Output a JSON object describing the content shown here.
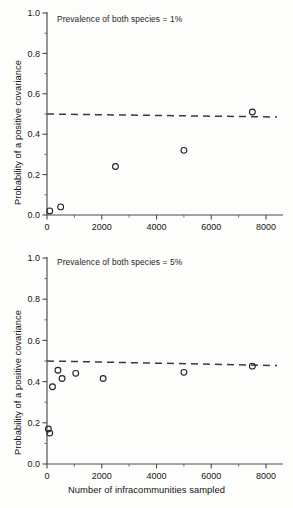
{
  "figure": {
    "xlabel": "Number of infracommunities sampled",
    "ylabel": "Probability of a positive covariance"
  },
  "chart_data": [
    {
      "type": "scatter",
      "title": "",
      "annotation": "Prevalence of both species = 1%",
      "xlabel": "",
      "ylabel": "Probability of a positive covariance",
      "xlim": [
        0,
        8400
      ],
      "ylim": [
        0,
        1.0
      ],
      "xticks": [
        0,
        2000,
        4000,
        6000,
        8000
      ],
      "xticklabels": [
        "0",
        "2000",
        "4000",
        "6000",
        "8000"
      ],
      "yticks": [
        0.0,
        0.2,
        0.4,
        0.6,
        0.8,
        1.0
      ],
      "yticklabels": [
        "0.0",
        "0.2",
        "0.4",
        "0.6",
        "0.8",
        "1.0"
      ],
      "grid": false,
      "legend": "none",
      "marker": "open-circle",
      "x": [
        100,
        500,
        2500,
        5000,
        7500
      ],
      "y": [
        0.02,
        0.04,
        0.24,
        0.32,
        0.51
      ],
      "reference_line": {
        "style": "dashed",
        "label": "0.5",
        "x": [
          0,
          8400
        ],
        "y": [
          0.5,
          0.485
        ]
      }
    },
    {
      "type": "scatter",
      "title": "",
      "annotation": "Prevalence of both species = 5%",
      "xlabel": "Number of infracommunities sampled",
      "ylabel": "Probability of a positive covariance",
      "xlim": [
        0,
        8400
      ],
      "ylim": [
        0,
        1.0
      ],
      "xticks": [
        0,
        2000,
        4000,
        6000,
        8000
      ],
      "xticklabels": [
        "0",
        "2000",
        "4000",
        "6000",
        "8000"
      ],
      "yticks": [
        0.0,
        0.2,
        0.4,
        0.6,
        0.8,
        1.0
      ],
      "yticklabels": [
        "0.0",
        "0.2",
        "0.4",
        "0.6",
        "0.8",
        "1.0"
      ],
      "grid": false,
      "legend": "none",
      "marker": "open-circle",
      "x": [
        50,
        100,
        200,
        400,
        550,
        1050,
        2050,
        5000,
        7500
      ],
      "y": [
        0.17,
        0.15,
        0.375,
        0.455,
        0.415,
        0.44,
        0.415,
        0.445,
        0.475
      ],
      "reference_line": {
        "style": "dashed",
        "label": "0.5",
        "x": [
          0,
          8400
        ],
        "y": [
          0.5,
          0.478
        ]
      }
    }
  ]
}
